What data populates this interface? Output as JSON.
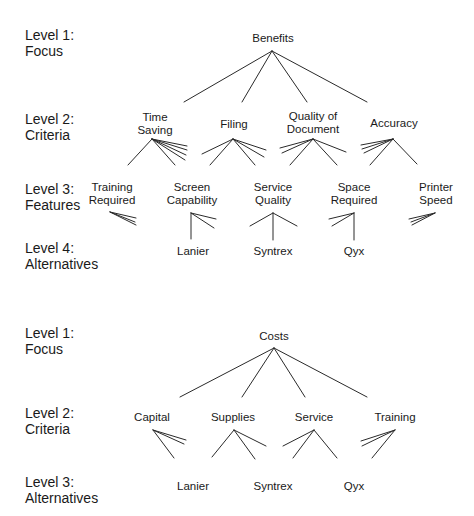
{
  "hierarchies": [
    {
      "id": "benefits",
      "levels": [
        {
          "label": "Level 1:",
          "name": "Focus"
        },
        {
          "label": "Level 2:",
          "name": "Criteria"
        },
        {
          "label": "Level 3:",
          "name": "Features"
        },
        {
          "label": "Level 4:",
          "name": "Alternatives"
        }
      ],
      "focus": "Benefits",
      "criteria": [
        {
          "line1": "Time",
          "line2": "Saving"
        },
        {
          "line1": "Filing",
          "line2": ""
        },
        {
          "line1": "Quality of",
          "line2": "Document"
        },
        {
          "line1": "Accuracy",
          "line2": ""
        }
      ],
      "features": [
        {
          "line1": "Training",
          "line2": "Required"
        },
        {
          "line1": "Screen",
          "line2": "Capability"
        },
        {
          "line1": "Service",
          "line2": "Quality"
        },
        {
          "line1": "Space",
          "line2": "Required"
        },
        {
          "line1": "Printer",
          "line2": "Speed"
        }
      ],
      "alternatives": [
        "Lanier",
        "Syntrex",
        "Qyx"
      ]
    },
    {
      "id": "costs",
      "levels": [
        {
          "label": "Level 1:",
          "name": "Focus"
        },
        {
          "label": "Level 2:",
          "name": "Criteria"
        },
        {
          "label": "Level 3:",
          "name": "Alternatives"
        }
      ],
      "focus": "Costs",
      "criteria": [
        {
          "line1": "Capital"
        },
        {
          "line1": "Supplies"
        },
        {
          "line1": "Service"
        },
        {
          "line1": "Training"
        }
      ],
      "alternatives": [
        "Lanier",
        "Syntrex",
        "Qyx"
      ]
    }
  ],
  "colors": {
    "line": "#2a2a2a",
    "text": "#1a1a1a",
    "background": "#ffffff"
  }
}
